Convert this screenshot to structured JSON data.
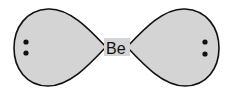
{
  "diagram": {
    "center_atom": "Be",
    "lobes": [
      {
        "side": "left",
        "lone_pair_dots": 2
      },
      {
        "side": "right",
        "lone_pair_dots": 2
      }
    ],
    "colors": {
      "lobe_fill": "#d4d4d4",
      "outline": "#111111",
      "dot": "#111111"
    }
  }
}
